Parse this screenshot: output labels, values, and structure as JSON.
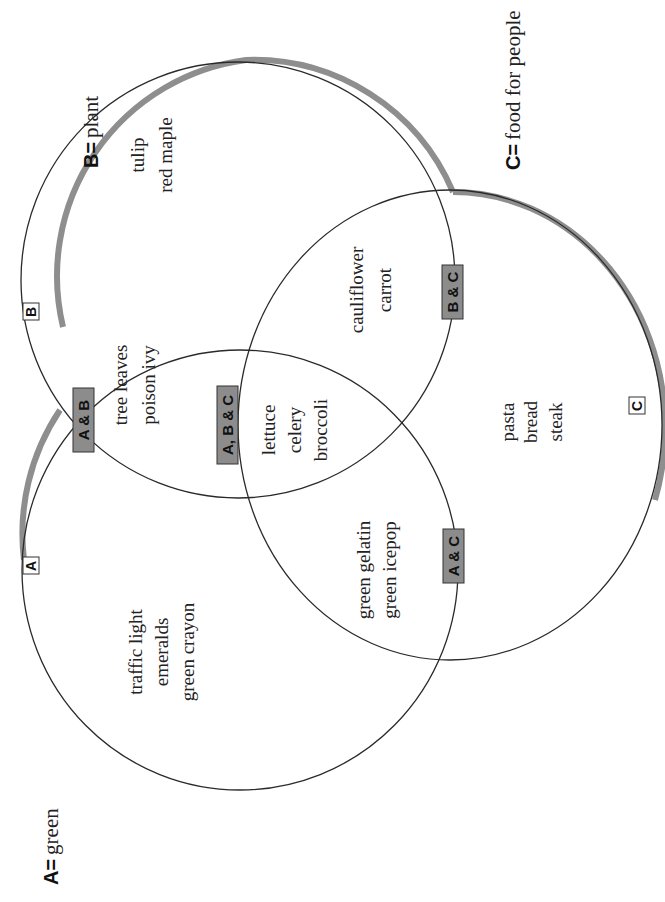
{
  "legend": {
    "a": {
      "key": "A=",
      "text": "green"
    },
    "b": {
      "key": "B=",
      "text": "plant"
    },
    "c": {
      "key": "C=",
      "text": "food for people"
    }
  },
  "circle_labels": {
    "a": "A",
    "b": "B",
    "c": "C"
  },
  "region_tags": {
    "ab": "A & B",
    "ac": "A & C",
    "bc": "B & C",
    "abc": "A, B & C"
  },
  "regions": {
    "a_only": [
      "traffic light",
      "emeralds",
      "green crayon"
    ],
    "b_only": [
      "tulip",
      "red maple"
    ],
    "c_only": [
      "pasta",
      "bread",
      "steak"
    ],
    "ab": [
      "tree leaves",
      "poison ivy"
    ],
    "ac": [
      "green gelatin",
      "green icepop"
    ],
    "bc": [
      "cauliflower",
      "carrot"
    ],
    "abc": [
      "lettuce",
      "celery",
      "broccoli"
    ]
  },
  "colors": {
    "outline": "#2a2a2a",
    "shadow": "#8e8e8e",
    "tag_fill": "#8c8c8c",
    "background": "#ffffff"
  }
}
